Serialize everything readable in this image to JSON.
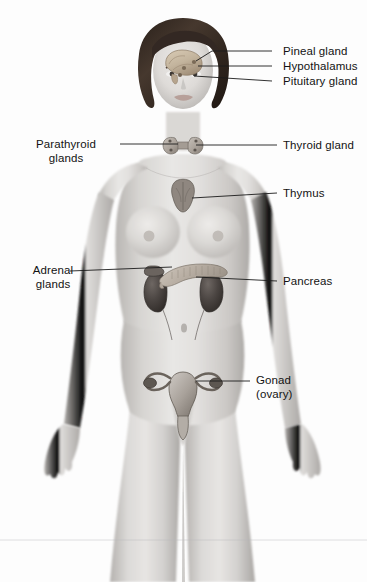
{
  "figure": {
    "background_color": "#fdfdfd",
    "skin_color": "#d8d6d4",
    "hair_color": "#3a2f28",
    "organ_dark_color": "#5b5450",
    "organ_light_color": "#bfb6ad"
  },
  "labels": [
    {
      "id": "pineal-gland",
      "lines": [
        "Pineal gland"
      ],
      "side": "right",
      "text_x": 283,
      "text_y": 45,
      "leader": {
        "x1": 272,
        "y1": 51,
        "x2": 212,
        "y2": 51,
        "x3": 196,
        "y3": 61
      }
    },
    {
      "id": "hypothalamus",
      "lines": [
        "Hypothalamus"
      ],
      "side": "right",
      "text_x": 283,
      "text_y": 60,
      "leader": {
        "x1": 272,
        "y1": 66,
        "x2": 198,
        "y2": 66,
        "x3": 198,
        "y3": 66
      }
    },
    {
      "id": "pituitary-gland",
      "lines": [
        "Pituitary gland"
      ],
      "side": "right",
      "text_x": 283,
      "text_y": 75,
      "leader": {
        "x1": 272,
        "y1": 81,
        "x2": 194,
        "y2": 76,
        "x3": 194,
        "y3": 76
      }
    },
    {
      "id": "parathyroid-glands",
      "lines": [
        "Parathyroid",
        "glands"
      ],
      "side": "left",
      "text_x": 16,
      "text_y": 138,
      "text_w": 100,
      "leader": {
        "x1": 120,
        "y1": 144,
        "x2": 178,
        "y2": 144,
        "x3": 178,
        "y3": 144
      }
    },
    {
      "id": "thyroid-gland",
      "lines": [
        "Thyroid gland"
      ],
      "side": "right",
      "text_x": 283,
      "text_y": 139,
      "leader": {
        "x1": 277,
        "y1": 145,
        "x2": 196,
        "y2": 145,
        "x3": 196,
        "y3": 145
      }
    },
    {
      "id": "thymus",
      "lines": [
        "Thymus"
      ],
      "side": "right",
      "text_x": 283,
      "text_y": 187,
      "leader": {
        "x1": 277,
        "y1": 193,
        "x2": 192,
        "y2": 198,
        "x3": 192,
        "y3": 198
      }
    },
    {
      "id": "adrenal-glands",
      "lines": [
        "Adrenal",
        "glands"
      ],
      "side": "left",
      "text_x": 14,
      "text_y": 264,
      "text_w": 78,
      "leader": {
        "x1": 70,
        "y1": 271,
        "x2": 172,
        "y2": 267,
        "x3": 172,
        "y3": 267
      }
    },
    {
      "id": "pancreas",
      "lines": [
        "Pancreas"
      ],
      "side": "right",
      "text_x": 283,
      "text_y": 275,
      "leader": {
        "x1": 277,
        "y1": 281,
        "x2": 196,
        "y2": 277,
        "x3": 196,
        "y3": 277
      }
    },
    {
      "id": "gonad-ovary",
      "lines": [
        "Gonad",
        "(ovary)"
      ],
      "side": "right",
      "text_x": 256,
      "text_y": 374,
      "leader": {
        "x1": 250,
        "y1": 381,
        "x2": 196,
        "y2": 381,
        "x3": 196,
        "y3": 381
      }
    }
  ],
  "organs": [
    {
      "id": "brain-sagittal",
      "name": "brain-with-pineal-hypothalamus-pituitary"
    },
    {
      "id": "thyroid",
      "name": "thyroid-and-parathyroid-glands"
    },
    {
      "id": "thymus",
      "name": "thymus-gland"
    },
    {
      "id": "kidneys-adrenals",
      "name": "kidneys-with-adrenal-glands"
    },
    {
      "id": "pancreas",
      "name": "pancreas"
    },
    {
      "id": "uterus-ovaries",
      "name": "uterus-with-ovaries"
    }
  ]
}
